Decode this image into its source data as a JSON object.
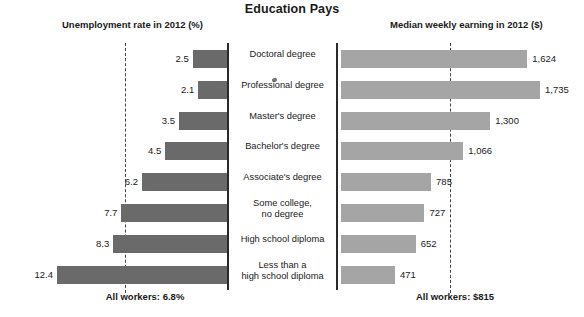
{
  "chart_data": {
    "type": "bar",
    "title": "Education Pays",
    "orientation": "horizontal",
    "layout": "diverging-two-panel",
    "grid": false,
    "legend": null,
    "categories": [
      "Doctoral degree",
      "Professional degree",
      "Master's degree",
      "Bachelor's degree",
      "Associate's degree",
      "Some college, no degree",
      "High school diploma",
      "Less than a high school diploma"
    ],
    "series": [
      {
        "name": "Unemployment rate in 2012 (%)",
        "panel": "left",
        "direction": "right-to-left",
        "unit": "%",
        "color": "#6a6a6a",
        "values": [
          2.5,
          2.1,
          3.5,
          4.5,
          6.2,
          7.7,
          8.3,
          12.4
        ],
        "labels": [
          "2.5",
          "2.1",
          "3.5",
          "4.5",
          "6.2",
          "7.7",
          "8.3",
          "12.4"
        ],
        "reference_line": {
          "value": 6.8,
          "label": "All workers: 6.8%"
        },
        "xlim": [
          0,
          14
        ]
      },
      {
        "name": "Median weekly earning in 2012 ($)",
        "panel": "right",
        "direction": "left-to-right",
        "unit": "$",
        "color": "#a5a5a5",
        "values": [
          1624,
          1735,
          1300,
          1066,
          785,
          727,
          652,
          471
        ],
        "labels": [
          "1,624",
          "1,735",
          "1,300",
          "1,066",
          "785",
          "727",
          "652",
          "471"
        ],
        "reference_line": {
          "value": 815,
          "label": "All workers: $815"
        },
        "xlim": [
          0,
          1900
        ]
      }
    ]
  },
  "header": {
    "title": "Education Pays",
    "left_axis_title": "Unemployment rate in 2012 (%)",
    "right_axis_title": "Median weekly earning in 2012 ($)"
  },
  "rows": [
    {
      "category": "Doctoral degree",
      "category_lines": [
        "Doctoral degree"
      ],
      "rate": "2.5",
      "earning": "1,624"
    },
    {
      "category": "Professional degree",
      "category_lines": [
        "Professional degree"
      ],
      "rate": "2.1",
      "earning": "1,735"
    },
    {
      "category": "Master's degree",
      "category_lines": [
        "Master's degree"
      ],
      "rate": "3.5",
      "earning": "1,300"
    },
    {
      "category": "Bachelor's degree",
      "category_lines": [
        "Bachelor's degree"
      ],
      "rate": "4.5",
      "earning": "1,066"
    },
    {
      "category": "Associate's degree",
      "category_lines": [
        "Associate's degree"
      ],
      "rate": "6.2",
      "earning": "785"
    },
    {
      "category": "Some college, no degree",
      "category_lines": [
        "Some college,",
        "no degree"
      ],
      "rate": "7.7",
      "earning": "727"
    },
    {
      "category": "High school diploma",
      "category_lines": [
        "High school diploma"
      ],
      "rate": "8.3",
      "earning": "652"
    },
    {
      "category": "Less than a high school diploma",
      "category_lines": [
        "Less than a",
        "high school diploma"
      ],
      "rate": "12.4",
      "earning": "471"
    }
  ],
  "footer": {
    "left": "All workers: 6.8%",
    "right": "All workers: $815"
  },
  "colors": {
    "left_bar": "#6a6a6a",
    "right_bar": "#a5a5a5",
    "axis": "#2a2a2a",
    "text": "#1a1a1a"
  }
}
